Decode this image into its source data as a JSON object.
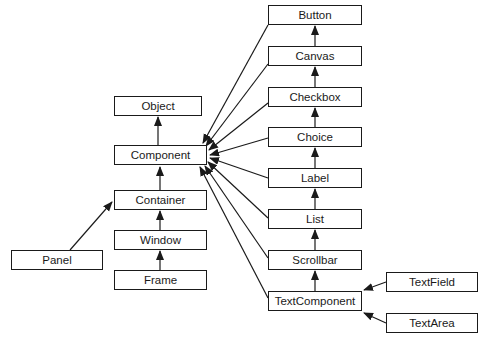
{
  "diagram": {
    "type": "class-hierarchy",
    "nodes": [
      {
        "id": "button",
        "label": "Button",
        "x": 268,
        "y": 5,
        "w": 94
      },
      {
        "id": "canvas",
        "label": "Canvas",
        "x": 268,
        "y": 46,
        "w": 94
      },
      {
        "id": "checkbox",
        "label": "Checkbox",
        "x": 268,
        "y": 87,
        "w": 94
      },
      {
        "id": "choice",
        "label": "Choice",
        "x": 268,
        "y": 127,
        "w": 94
      },
      {
        "id": "label",
        "label": "Label",
        "x": 268,
        "y": 168,
        "w": 94
      },
      {
        "id": "list",
        "label": "List",
        "x": 268,
        "y": 209,
        "w": 94
      },
      {
        "id": "scrollbar",
        "label": "Scrollbar",
        "x": 268,
        "y": 250,
        "w": 94
      },
      {
        "id": "textcomponent",
        "label": "TextComponent",
        "x": 268,
        "y": 291,
        "w": 94
      },
      {
        "id": "object",
        "label": "Object",
        "x": 114,
        "y": 96,
        "w": 88
      },
      {
        "id": "component",
        "label": "Component",
        "x": 114,
        "y": 145,
        "w": 93
      },
      {
        "id": "container",
        "label": "Container",
        "x": 114,
        "y": 190,
        "w": 93
      },
      {
        "id": "window",
        "label": "Window",
        "x": 114,
        "y": 230,
        "w": 93
      },
      {
        "id": "frame",
        "label": "Frame",
        "x": 114,
        "y": 270,
        "w": 93
      },
      {
        "id": "panel",
        "label": "Panel",
        "x": 11,
        "y": 250,
        "w": 92
      },
      {
        "id": "textfield",
        "label": "TextField",
        "x": 386,
        "y": 272,
        "w": 92
      },
      {
        "id": "textarea",
        "label": "TextArea",
        "x": 386,
        "y": 313,
        "w": 92
      }
    ],
    "edges": [
      {
        "from": "component",
        "to": "object"
      },
      {
        "from": "container",
        "to": "component"
      },
      {
        "from": "window",
        "to": "container"
      },
      {
        "from": "frame",
        "to": "window"
      },
      {
        "from": "panel",
        "to": "container"
      },
      {
        "from": "button",
        "to": "component"
      },
      {
        "from": "canvas",
        "to": "component"
      },
      {
        "from": "checkbox",
        "to": "component"
      },
      {
        "from": "choice",
        "to": "component"
      },
      {
        "from": "label",
        "to": "component"
      },
      {
        "from": "list",
        "to": "component"
      },
      {
        "from": "scrollbar",
        "to": "component"
      },
      {
        "from": "textcomponent",
        "to": "component"
      },
      {
        "from": "canvas",
        "to": "button"
      },
      {
        "from": "checkbox",
        "to": "canvas"
      },
      {
        "from": "choice",
        "to": "checkbox"
      },
      {
        "from": "label",
        "to": "choice"
      },
      {
        "from": "list",
        "to": "label"
      },
      {
        "from": "scrollbar",
        "to": "list"
      },
      {
        "from": "textcomponent",
        "to": "scrollbar"
      },
      {
        "from": "textfield",
        "to": "textcomponent"
      },
      {
        "from": "textarea",
        "to": "textcomponent"
      }
    ]
  }
}
